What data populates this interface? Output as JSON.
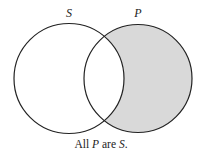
{
  "diagram": {
    "type": "venn",
    "sets": [
      {
        "id": "S",
        "label": "S",
        "shaded": false
      },
      {
        "id": "P",
        "label": "P",
        "shaded_region": "P minus S"
      }
    ],
    "colors": {
      "stroke": "#222222",
      "shade": "#d9d9d9",
      "background": "#ffffff"
    }
  },
  "caption": {
    "prefix": "All",
    "subject": "P",
    "copula": "are",
    "predicate": "S",
    "suffix": "."
  }
}
